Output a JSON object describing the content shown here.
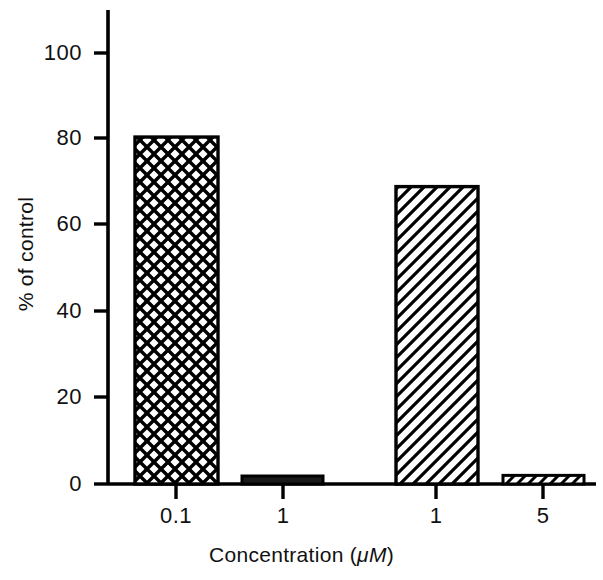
{
  "chart_data": {
    "type": "bar",
    "title": "",
    "subtitle": "",
    "xlabel_text": "Concentration (",
    "xlabel_unit_italic": "μM",
    "xlabel_tail": ")",
    "xlabel": "Concentration (μM)",
    "ylabel": "% of control",
    "categories": [
      "0.1",
      "1",
      "1",
      "5"
    ],
    "values": [
      80.5,
      0.5,
      69,
      2
    ],
    "bar_patterns": [
      "crosshatch",
      "solid",
      "diagonal-hatch",
      "diagonal-hatch"
    ],
    "ylim": [
      0,
      108
    ],
    "yticks": [
      0,
      20,
      40,
      60,
      80,
      100
    ],
    "ytick_labels": [
      "0",
      "20",
      "40",
      "60",
      "80",
      "100"
    ],
    "xticks": [
      1,
      2,
      3,
      4
    ],
    "grid": false,
    "legend": null,
    "legend_position": "none",
    "colors": {
      "axis": "#000000",
      "bar_outline": "#000000",
      "bar_fill": "#ffffff",
      "pattern": "#000000",
      "background": "#ffffff",
      "text": "#111111"
    }
  }
}
